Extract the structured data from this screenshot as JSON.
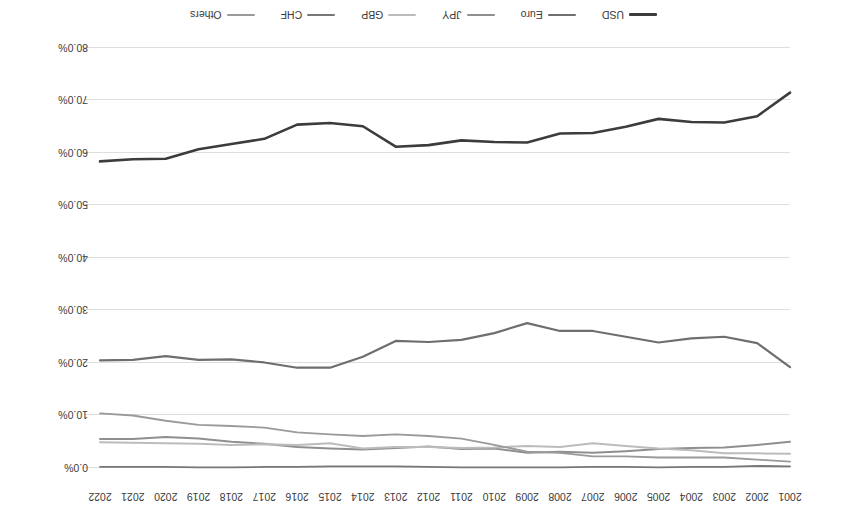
{
  "chart_data": {
    "type": "line",
    "title": "",
    "subtitle": "",
    "xlabel": "",
    "ylabel": "",
    "grid": true,
    "legend_position": "bottom",
    "rotation_degrees": 180,
    "ylim": [
      0.0,
      80.0
    ],
    "ytick_labels": [
      "0.0%",
      "10.0%",
      "20.0%",
      "30.0%",
      "40.0%",
      "50.0%",
      "60.0%",
      "70.0%",
      "80.0%"
    ],
    "ytick_values": [
      0.0,
      10.0,
      20.0,
      30.0,
      40.0,
      50.0,
      60.0,
      70.0,
      80.0
    ],
    "categories": [
      "2001",
      "2002",
      "2003",
      "2004",
      "2005",
      "2006",
      "2007",
      "2008",
      "2009",
      "2010",
      "2011",
      "2012",
      "2013",
      "2014",
      "2015",
      "2016",
      "2017",
      "2018",
      "2019",
      "2020",
      "2021",
      "2022"
    ],
    "series": [
      {
        "name": "USD",
        "color": "#3c3c3c",
        "width": 2.6,
        "values": [
          71.5,
          67.0,
          65.8,
          65.9,
          66.5,
          65.0,
          63.8,
          63.7,
          62.0,
          62.1,
          62.4,
          61.5,
          61.2,
          65.1,
          65.7,
          65.4,
          62.7,
          61.7,
          60.7,
          58.9,
          58.8,
          58.4
        ]
      },
      {
        "name": "Euro",
        "color": "#6e6e6e",
        "width": 2.2,
        "values": [
          19.2,
          23.8,
          25.0,
          24.7,
          23.9,
          25.0,
          26.1,
          26.1,
          27.6,
          25.7,
          24.4,
          24.0,
          24.2,
          21.2,
          19.1,
          19.1,
          20.1,
          20.7,
          20.6,
          21.3,
          20.6,
          20.5
        ]
      },
      {
        "name": "JPY",
        "color": "#8f8f8f",
        "width": 2.0,
        "values": [
          5.0,
          4.4,
          3.9,
          3.8,
          3.6,
          3.2,
          2.9,
          3.1,
          2.9,
          3.7,
          3.6,
          4.1,
          3.8,
          3.5,
          3.7,
          4.0,
          4.6,
          5.0,
          5.6,
          5.9,
          5.5,
          5.5
        ]
      },
      {
        "name": "GBP",
        "color": "#bcbcbc",
        "width": 2.0,
        "values": [
          2.7,
          2.8,
          2.8,
          3.4,
          3.7,
          4.2,
          4.7,
          4.0,
          4.2,
          3.9,
          3.8,
          4.0,
          4.0,
          3.7,
          4.7,
          4.4,
          4.5,
          4.4,
          4.6,
          4.7,
          4.8,
          4.9
        ]
      },
      {
        "name": "CHF",
        "color": "#777777",
        "width": 1.8,
        "values": [
          0.3,
          0.4,
          0.2,
          0.2,
          0.1,
          0.2,
          0.2,
          0.1,
          0.1,
          0.1,
          0.1,
          0.2,
          0.3,
          0.3,
          0.3,
          0.2,
          0.2,
          0.1,
          0.1,
          0.2,
          0.2,
          0.2
        ]
      },
      {
        "name": "Others",
        "color": "#9a9a9a",
        "width": 1.8,
        "values": [
          1.2,
          1.6,
          2.0,
          2.0,
          2.0,
          2.2,
          2.2,
          2.9,
          3.1,
          4.4,
          5.6,
          6.1,
          6.4,
          6.1,
          6.4,
          6.8,
          7.7,
          8.0,
          8.2,
          9.0,
          10.0,
          10.4
        ]
      }
    ],
    "legend_entries": [
      {
        "label": "USD",
        "color": "#3c3c3c",
        "width": 3.0
      },
      {
        "label": "Euro",
        "color": "#6e6e6e",
        "width": 2.6
      },
      {
        "label": "JPY",
        "color": "#8f8f8f",
        "width": 2.4
      },
      {
        "label": "GBP",
        "color": "#bcbcbc",
        "width": 2.4
      },
      {
        "label": "CHF",
        "color": "#777777",
        "width": 2.4
      },
      {
        "label": "Others",
        "color": "#9a9a9a",
        "width": 2.4
      }
    ]
  }
}
